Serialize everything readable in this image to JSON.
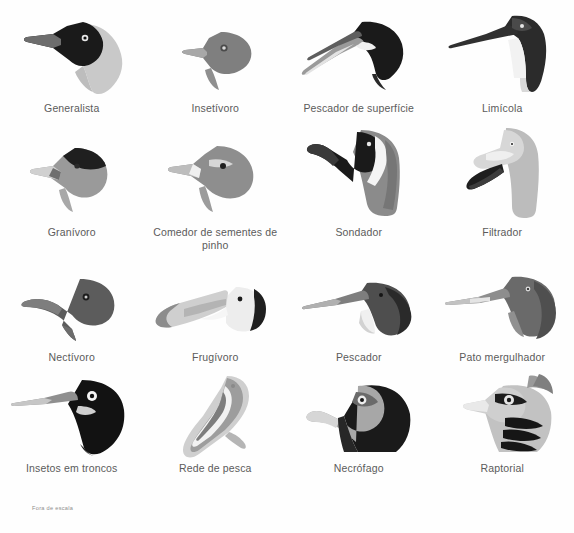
{
  "figure": {
    "title": "",
    "footnote": "Fora de escala",
    "background_color": "#fefefe",
    "caption_color": "#5b5b5b",
    "ink_dark": "#1a1a1a",
    "ink_mid": "#808080",
    "ink_light": "#c9c9c9",
    "columns": 4,
    "rows": 4
  },
  "items": [
    {
      "label": "Generalista",
      "icon": "crow-head-icon"
    },
    {
      "label": "Insetívoro",
      "icon": "warbler-head-icon"
    },
    {
      "label": "Pescador de superfície",
      "icon": "skimmer-head-icon"
    },
    {
      "label": "Limícola",
      "icon": "godwit-head-icon"
    },
    {
      "label": "Granívoro",
      "icon": "finch-head-icon"
    },
    {
      "label": "Comedor de sementes de pinho",
      "icon": "crossbill-head-icon"
    },
    {
      "label": "Sondador",
      "icon": "ibis-head-icon"
    },
    {
      "label": "Filtrador",
      "icon": "flamingo-head-icon"
    },
    {
      "label": "Nectívoro",
      "icon": "hummingbird-head-icon"
    },
    {
      "label": "Frugívoro",
      "icon": "toucan-head-icon"
    },
    {
      "label": "Pescador",
      "icon": "kingfisher-head-icon"
    },
    {
      "label": "Pato mergulhador",
      "icon": "merganser-head-icon"
    },
    {
      "label": "Insetos em troncos",
      "icon": "woodpecker-head-icon"
    },
    {
      "label": "Rede de pesca",
      "icon": "pelican-head-icon"
    },
    {
      "label": "Necrófago",
      "icon": "vulture-head-icon"
    },
    {
      "label": "Raptorial",
      "icon": "eagle-head-icon"
    }
  ]
}
